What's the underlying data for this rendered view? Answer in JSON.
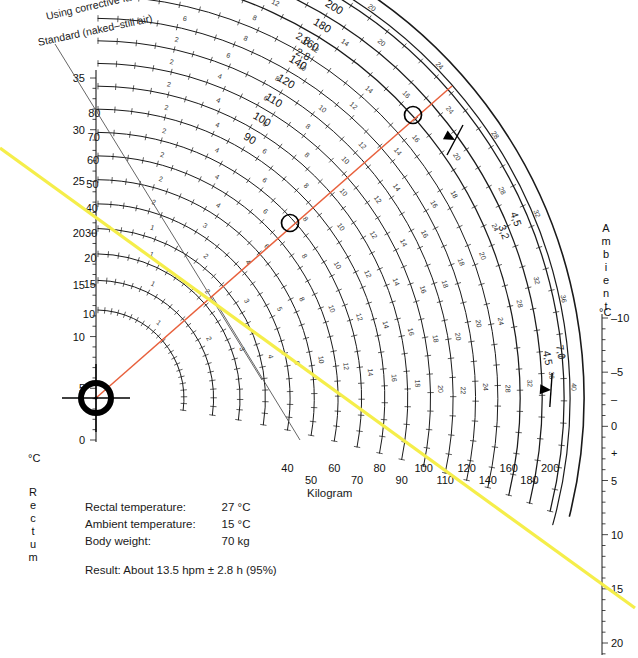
{
  "figure": {
    "type": "nomogram",
    "name": "Henssge nomogram for time since death estimation",
    "header_lines": [
      {
        "id": "corrective",
        "text": "Using corrective factors"
      },
      {
        "id": "standard",
        "text": "Standard (naked–still air)"
      }
    ],
    "corner_labels": [
      {
        "id": "cf-outer",
        "text": "2,8"
      },
      {
        "id": "cf-inner",
        "text": "2,8"
      }
    ],
    "right_arc_labels": [
      {
        "id": "cf-4-5-upper",
        "text": "4,5"
      },
      {
        "id": "cf-3-2",
        "text": "3,2"
      },
      {
        "id": "cf-7-0",
        "text": "7,0"
      },
      {
        "id": "cf-4-5-lower",
        "text": "4,5"
      }
    ]
  },
  "left_axis": {
    "title": "Rectum",
    "unit": "°C",
    "title_letters": [
      "R",
      "e",
      "c",
      "t",
      "u",
      "m"
    ],
    "ticks": [
      0,
      5,
      10,
      15,
      20,
      25,
      30,
      35
    ],
    "min": 0,
    "max": 37.5,
    "minor_step": 1
  },
  "right_axis": {
    "title": "Ambient",
    "unit": "°C",
    "title_letters": [
      "A",
      "m",
      "b",
      "i",
      "e",
      "n",
      "t"
    ],
    "ticks": [
      {
        "value": -10,
        "label": "–10"
      },
      {
        "value": -5,
        "label": "–5"
      },
      {
        "value": -2.5,
        "label": "–"
      },
      {
        "value": 0,
        "label": "0"
      },
      {
        "value": 2.5,
        "label": "+"
      },
      {
        "value": 5,
        "label": "5"
      },
      {
        "value": 10,
        "label": "10"
      },
      {
        "value": 15,
        "label": "15"
      },
      {
        "value": 20,
        "label": "20"
      }
    ],
    "min": -10,
    "max": 21.5
  },
  "bottom_axis": {
    "caption": "Kilogram",
    "labels_upper": [
      "10",
      "20",
      "40",
      "60",
      "80",
      "100",
      "120",
      "160",
      "200"
    ],
    "labels_lower": [
      "15",
      "30",
      "50",
      "70",
      "90",
      "110",
      "140",
      "180"
    ],
    "all_weights": [
      10,
      15,
      20,
      30,
      40,
      50,
      60,
      70,
      80,
      90,
      100,
      110,
      120,
      140,
      160,
      180,
      200
    ]
  },
  "weight_curves": [
    {
      "weight": 10,
      "left_label": "10",
      "top_label": "",
      "hour_labels": [
        "1"
      ]
    },
    {
      "weight": 15,
      "left_label": "15",
      "top_label": "",
      "hour_labels": [
        "1",
        "2"
      ]
    },
    {
      "weight": 20,
      "left_label": "20",
      "top_label": "",
      "hour_labels": [
        "1",
        "2",
        "3"
      ]
    },
    {
      "weight": 30,
      "left_label": "30",
      "top_label": "",
      "hour_labels": [
        "1",
        "2",
        "3",
        "4"
      ]
    },
    {
      "weight": 40,
      "left_label": "40",
      "top_label": "",
      "hour_labels": [
        "2",
        "3",
        "4",
        "5",
        "6"
      ]
    },
    {
      "weight": 50,
      "left_label": "50",
      "top_label": "",
      "hour_labels": [
        "2",
        "4",
        "6",
        "8",
        "10"
      ]
    },
    {
      "weight": 60,
      "left_label": "60",
      "top_label": "",
      "hour_labels": [
        "2",
        "4",
        "6",
        "8",
        "10",
        "12"
      ]
    },
    {
      "weight": 70,
      "left_label": "70",
      "top_label": "",
      "hour_labels": [
        "2",
        "4",
        "6",
        "8",
        "10",
        "12",
        "14"
      ]
    },
    {
      "weight": 80,
      "left_label": "80",
      "top_label": "",
      "hour_labels": [
        "2",
        "4",
        "6",
        "8",
        "10",
        "12",
        "14",
        "16"
      ]
    },
    {
      "weight": 90,
      "left_label": "",
      "top_label": "90",
      "hour_labels": [
        "2",
        "4",
        "6",
        "8",
        "10",
        "12",
        "14",
        "16",
        "18"
      ]
    },
    {
      "weight": 100,
      "left_label": "",
      "top_label": "100",
      "hour_labels": [
        "2",
        "4",
        "6",
        "8",
        "10",
        "12",
        "14",
        "16",
        "18",
        "20"
      ]
    },
    {
      "weight": 110,
      "left_label": "",
      "top_label": "110",
      "hour_labels": [
        "2",
        "6",
        "8",
        "10",
        "12",
        "14",
        "16",
        "18",
        "20",
        "22"
      ]
    },
    {
      "weight": 120,
      "left_label": "",
      "top_label": "120",
      "hour_labels": [
        "6",
        "8",
        "10",
        "12",
        "14",
        "16",
        "18",
        "20",
        "24"
      ]
    },
    {
      "weight": 140,
      "left_label": "",
      "top_label": "140",
      "hour_labels": [
        "6",
        "8",
        "12",
        "14",
        "16",
        "18",
        "20",
        "24",
        "28"
      ]
    },
    {
      "weight": 160,
      "left_label": "",
      "top_label": "160",
      "hour_labels": [
        "10",
        "12",
        "14",
        "16",
        "20",
        "24",
        "28",
        "32"
      ]
    },
    {
      "weight": 180,
      "left_label": "",
      "top_label": "180",
      "hour_labels": [
        "10",
        "15",
        "20",
        "24",
        "28",
        "32",
        "36"
      ]
    },
    {
      "weight": 200,
      "left_label": "",
      "top_label": "200",
      "hour_labels": [
        "10",
        "15",
        "20",
        "24",
        "28",
        "32",
        "36",
        "40"
      ]
    }
  ],
  "case": {
    "rows": [
      {
        "label": "Rectal temperature:",
        "value": "27 °C"
      },
      {
        "label": "Ambient temperature:",
        "value": "15 °C"
      },
      {
        "label": "Body weight:",
        "value": "70 kg"
      }
    ],
    "result": "Result: About 13.5 hpm ± 2.8 h (95%)"
  },
  "markers": {
    "origin_target": {
      "name": "origin-crosshair",
      "x": 96,
      "y": 398
    },
    "intersections": [
      {
        "name": "intersection-weight-curve",
        "x": 290,
        "y": 223
      },
      {
        "name": "intersection-outer-arc",
        "x": 413,
        "y": 115
      }
    ],
    "arrow_ticks": [
      {
        "name": "upper-confidence-arrow",
        "x": 455,
        "y": 140
      },
      {
        "name": "lower-confidence-arrow",
        "x": 551,
        "y": 390
      }
    ]
  },
  "construction_lines": [
    {
      "name": "orange-reading-line",
      "color": "#e8603c",
      "x1": 96,
      "y1": 398,
      "x2": 452,
      "y2": 86
    },
    {
      "name": "yellow-diagonal-line",
      "color": "#f5ee4a",
      "x1": 0,
      "y1": 148,
      "x2": 635,
      "y2": 608
    }
  ],
  "colors": {
    "orange": "#e8603c",
    "yellow": "#f5ee4a",
    "curve": "#1a1a1a",
    "text": "#1a1a1a"
  }
}
